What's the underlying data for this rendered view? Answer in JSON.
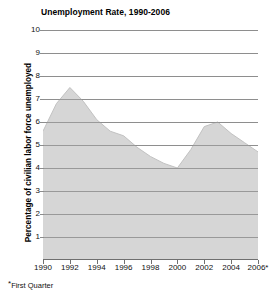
{
  "figure": {
    "title": "Unemployment Rate, 1990-2006",
    "footnote_marker": "*",
    "footnote_text": "First Quarter",
    "y_axis_title": "Percentage of civilian labor force unemployed"
  },
  "chart_data": {
    "type": "area",
    "title": "Unemployment Rate, 1990-2006",
    "xlabel": "",
    "ylabel": "Percentage of civilian labor force unemployed",
    "xlim": [
      1990,
      2006
    ],
    "ylim": [
      0,
      10
    ],
    "ytick_labels": [
      "1",
      "2",
      "3",
      "4",
      "5",
      "6",
      "7",
      "8",
      "9",
      "10"
    ],
    "ytick_values": [
      1,
      2,
      3,
      4,
      5,
      6,
      7,
      8,
      9,
      10
    ],
    "xtick_labels": [
      "1990",
      "1992",
      "1994",
      "1996",
      "1998",
      "2000",
      "2002",
      "2004",
      "2006*"
    ],
    "xtick_values": [
      1990,
      1992,
      1994,
      1996,
      1998,
      2000,
      2002,
      2004,
      2006
    ],
    "grid": "horizontal",
    "legend": "none",
    "fill_color": "#d6d6d6",
    "grid_color": "#8c8c8c",
    "annotations": [
      "*First Quarter"
    ],
    "x": [
      1990,
      1991,
      1992,
      1993,
      1994,
      1995,
      1996,
      1997,
      1998,
      1999,
      2000,
      2001,
      2002,
      2003,
      2004,
      2005,
      2006
    ],
    "values": [
      5.6,
      6.8,
      7.5,
      6.9,
      6.1,
      5.6,
      5.4,
      4.9,
      4.5,
      4.2,
      4.0,
      4.8,
      5.8,
      6.0,
      5.5,
      5.1,
      4.7
    ],
    "series": [
      {
        "name": "Unemployment rate",
        "values": [
          5.6,
          6.8,
          7.5,
          6.9,
          6.1,
          5.6,
          5.4,
          4.9,
          4.5,
          4.2,
          4.0,
          4.8,
          5.8,
          6.0,
          5.5,
          5.1,
          4.7
        ]
      }
    ]
  }
}
